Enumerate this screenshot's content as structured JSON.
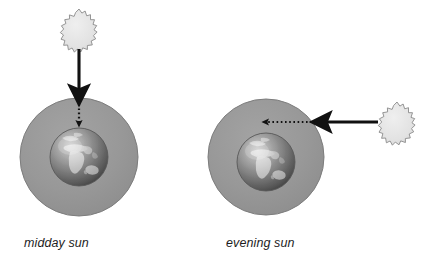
{
  "figure": {
    "background_color": "#ffffff",
    "panels": [
      {
        "id": "midday",
        "caption": "midday sun",
        "sun_label": "sun-icon",
        "atmosphere_label": "atmosphere-circle",
        "earth_label": "earth-globe",
        "solid_ray_label": "solid-ray-arrow",
        "dotted_ray_label": "dotted-ray-arrow",
        "ray_direction": "downward",
        "atmosphere": {
          "cx": 79,
          "cy": 157,
          "r": 59
        },
        "earth": {
          "cx": 79,
          "cy": 157,
          "r": 29
        },
        "sun": {
          "cx": 79,
          "cy": 29,
          "r": 20,
          "points": 20
        },
        "solid_ray": {
          "x1": 79,
          "y1": 50,
          "x2": 79,
          "y2": 98
        },
        "dotted_ray": {
          "x1": 79,
          "y1": 100,
          "x2": 79,
          "y2": 127
        }
      },
      {
        "id": "evening",
        "caption": "evening sun",
        "sun_label": "sun-icon",
        "atmosphere_label": "atmosphere-circle",
        "earth_label": "earth-globe",
        "solid_ray_label": "solid-ray-arrow",
        "dotted_ray_label": "dotted-ray-arrow",
        "ray_direction": "leftward",
        "atmosphere": {
          "cx": 266,
          "cy": 157,
          "r": 58
        },
        "earth": {
          "cx": 266,
          "cy": 162,
          "r": 29
        },
        "sun": {
          "cx": 397,
          "cy": 122,
          "r": 20,
          "points": 20
        },
        "solid_ray": {
          "x1": 376,
          "y1": 122,
          "x2": 318,
          "y2": 122
        },
        "dotted_ray": {
          "x1": 315,
          "y1": 122,
          "x2": 262,
          "y2": 122
        }
      }
    ],
    "colors": {
      "atmosphere_fill": "#989898",
      "atmosphere_edge": "#7d7d7d",
      "sun_fill": "#e4e4e4",
      "sun_edge": "#8a8a8a",
      "arrow_color": "#111111",
      "ocean_dark": "#4f4f4f",
      "ocean_mid": "#8d8d8d",
      "land_light": "#e6e6e6",
      "caption_color": "#1d1d1d"
    }
  }
}
